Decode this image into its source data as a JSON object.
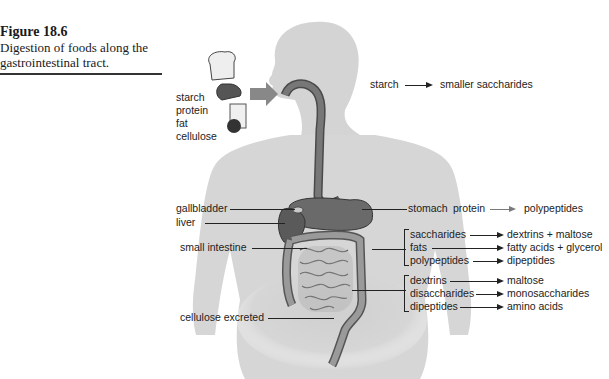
{
  "caption": {
    "title": "Figure 18.6",
    "text": "Digestion of foods along the gastrointestinal tract."
  },
  "food_inputs": {
    "items": [
      "starch",
      "protein",
      "fat",
      "cellulose"
    ]
  },
  "mouth": {
    "reaction": {
      "from": "starch",
      "to": "smaller saccharides"
    }
  },
  "left_labels": {
    "gallbladder": "gallbladder",
    "liver": "liver",
    "small_intestine": "small intestine",
    "cellulose_excreted": "cellulose excreted"
  },
  "stomach": {
    "label": "stomach",
    "reaction": {
      "from": "protein",
      "to": "polypeptides"
    }
  },
  "small_intestine_group1": [
    {
      "from": "saccharides",
      "to": "dextrins + maltose"
    },
    {
      "from": "fats",
      "to": "fatty acids + glycerol"
    },
    {
      "from": "polypeptides",
      "to": "dipeptides"
    }
  ],
  "small_intestine_group2": [
    {
      "from": "dextrins",
      "to": "maltose"
    },
    {
      "from": "disaccharides",
      "to": "monosaccharides"
    },
    {
      "from": "dipeptides",
      "to": "amino acids"
    }
  ],
  "colors": {
    "body": "#d4d4d4",
    "organ": "#7a7a7a",
    "organ_dark": "#4a4a4a",
    "text": "#1a1a1a"
  }
}
